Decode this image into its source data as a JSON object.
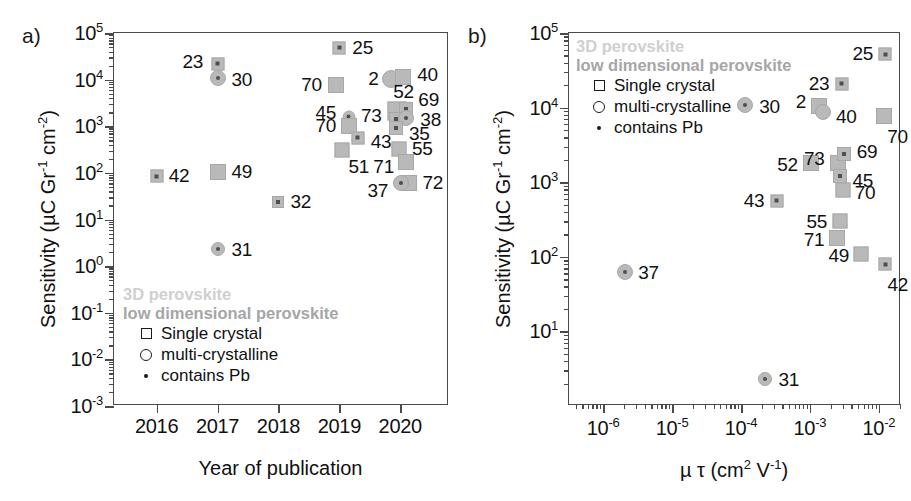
{
  "figure": {
    "panel_a_letter": "a)",
    "panel_b_letter": "b)"
  },
  "legend": {
    "head1": "3D perovskite",
    "head2": "low dimensional perovskite",
    "rows": [
      {
        "glyph": "square",
        "label": "Single crystal"
      },
      {
        "glyph": "circle",
        "label": "multi-crystalline"
      },
      {
        "glyph": "dot",
        "label": "contains Pb"
      }
    ],
    "colors": {
      "head1": "#cfcfcf",
      "head2": "#a6a6a6",
      "marker_fill": "#b9b9b9",
      "marker_edge": "#a8a8a8",
      "pb_dot": "#4f4f4f",
      "axis": "#4a4a4a",
      "text": "#111111"
    }
  },
  "chart_data": [
    {
      "id": "panel-a",
      "type": "scatter",
      "title": "",
      "xlabel": "Year of publication",
      "ylabel": "Sensitivity (µC Gr⁻¹ cm⁻²)",
      "xscale": "linear",
      "yscale": "log",
      "xlim": [
        2015.3,
        2020.8
      ],
      "ylim": [
        0.001,
        100000
      ],
      "xticks": [
        2016,
        2017,
        2018,
        2019,
        2020
      ],
      "xticklabels": [
        "2016",
        "2017",
        "2018",
        "2019",
        "2020"
      ],
      "yticks": [
        0.001,
        0.01,
        0.1,
        1,
        10,
        100,
        1000,
        10000,
        100000
      ],
      "yticklabels": [
        "10-3",
        "10-2",
        "10-1",
        "100",
        "101",
        "102",
        "103",
        "104",
        "105"
      ],
      "grid": false,
      "legend_position": "lower-left-inside",
      "points": [
        {
          "ref": "42",
          "x": 2016.0,
          "y": 85,
          "marker": "square",
          "pb": true,
          "size": 13,
          "label_dx": 12,
          "label_dy": 0
        },
        {
          "ref": "23",
          "x": 2017.0,
          "y": 22000,
          "marker": "square",
          "pb": true,
          "size": 13,
          "label_dx": -14,
          "label_dy": -2,
          "label_anchor": "end"
        },
        {
          "ref": "30",
          "x": 2017.0,
          "y": 11000,
          "marker": "circle",
          "pb": true,
          "size": 16,
          "label_dx": 14,
          "label_dy": 2
        },
        {
          "ref": "49",
          "x": 2017.0,
          "y": 105,
          "marker": "square",
          "pb": false,
          "size": 16,
          "label_dx": 14,
          "label_dy": 0
        },
        {
          "ref": "31",
          "x": 2017.0,
          "y": 2.3,
          "marker": "circle",
          "pb": true,
          "size": 14,
          "label_dx": 14,
          "label_dy": 1
        },
        {
          "ref": "32",
          "x": 2018.0,
          "y": 24,
          "marker": "square",
          "pb": true,
          "size": 12,
          "label_dx": 12,
          "label_dy": 0
        },
        {
          "ref": "25",
          "x": 2019.0,
          "y": 48000,
          "marker": "square",
          "pb": true,
          "size": 13,
          "label_dx": 13,
          "label_dy": 0
        },
        {
          "ref": "70",
          "x": 2018.95,
          "y": 7800,
          "marker": "square",
          "pb": false,
          "size": 16,
          "label_dx": -14,
          "label_dy": 0,
          "label_anchor": "end"
        },
        {
          "ref": "45",
          "x": 2019.15,
          "y": 1600,
          "marker": "circle",
          "pb": true,
          "size": 13,
          "label_dx": -12,
          "label_dy": -4,
          "label_anchor": "end"
        },
        {
          "ref": "70",
          "x": 2019.15,
          "y": 1000,
          "marker": "square",
          "pb": false,
          "size": 16,
          "label_dx": -12,
          "label_dy": 0,
          "label_anchor": "end"
        },
        {
          "ref": "43",
          "x": 2019.3,
          "y": 560,
          "marker": "square",
          "pb": true,
          "size": 13,
          "label_dx": 13,
          "label_dy": 4
        },
        {
          "ref": "51",
          "x": 2019.05,
          "y": 310,
          "marker": "square",
          "pb": false,
          "size": 15,
          "label_dx": 6,
          "label_dy": 17
        },
        {
          "ref": "2",
          "x": 2019.85,
          "y": 10500,
          "marker": "circle",
          "pb": false,
          "size": 18,
          "label_dx": -13,
          "label_dy": 0,
          "label_anchor": "end"
        },
        {
          "ref": "40",
          "x": 2020.05,
          "y": 11500,
          "marker": "square",
          "pb": false,
          "size": 16,
          "label_dx": 14,
          "label_dy": -2
        },
        {
          "ref": "52",
          "x": 2019.95,
          "y": 2100,
          "marker": "square",
          "pb": false,
          "size": 19,
          "label_dx": -4,
          "label_dy": -19
        },
        {
          "ref": "69",
          "x": 2020.1,
          "y": 2350,
          "marker": "square",
          "pb": true,
          "size": 14,
          "label_dx": 12,
          "label_dy": -9
        },
        {
          "ref": "73",
          "x": 2019.93,
          "y": 1400,
          "marker": "square",
          "pb": true,
          "size": 14,
          "label_dx": -14,
          "label_dy": -3,
          "label_anchor": "end"
        },
        {
          "ref": "38",
          "x": 2020.1,
          "y": 1500,
          "marker": "circle",
          "pb": true,
          "size": 16,
          "label_dx": 14,
          "label_dy": 2
        },
        {
          "ref": "35",
          "x": 2019.93,
          "y": 900,
          "marker": "square",
          "pb": true,
          "size": 14,
          "label_dx": 13,
          "label_dy": 6
        },
        {
          "ref": "55",
          "x": 2019.98,
          "y": 330,
          "marker": "square",
          "pb": false,
          "size": 15,
          "label_dx": 13,
          "label_dy": 0
        },
        {
          "ref": "71",
          "x": 2020.1,
          "y": 175,
          "marker": "square",
          "pb": false,
          "size": 16,
          "label_dx": -12,
          "label_dy": 5,
          "label_anchor": "end"
        },
        {
          "ref": "72",
          "x": 2020.15,
          "y": 62,
          "marker": "square",
          "pb": false,
          "size": 16,
          "label_dx": 13,
          "label_dy": 0
        },
        {
          "ref": "37",
          "x": 2020.02,
          "y": 62,
          "marker": "circle",
          "pb": true,
          "size": 16,
          "label_dx": -13,
          "label_dy": 8,
          "label_anchor": "end"
        }
      ]
    },
    {
      "id": "panel-b",
      "type": "scatter",
      "title": "",
      "xlabel": "µ τ (cm² V⁻¹)",
      "ylabel": "Sensitivity (µC Gr⁻¹ cm⁻²)",
      "xscale": "log",
      "yscale": "log",
      "xlim": [
        3.2e-07,
        0.021
      ],
      "ylim": [
        1.0,
        100000
      ],
      "xticks": [
        1e-06,
        1e-05,
        0.0001,
        0.001,
        0.01
      ],
      "xticklabels": [
        "10-6",
        "10-5",
        "10-4",
        "10-3",
        "10-2"
      ],
      "yticks": [
        10,
        100,
        1000,
        10000,
        100000
      ],
      "yticklabels": [
        "101",
        "102",
        "103",
        "104",
        "105"
      ],
      "grid": false,
      "legend_position": "upper-left-inside",
      "points": [
        {
          "ref": "37",
          "x": 2.1e-06,
          "y": 62,
          "marker": "circle",
          "pb": true,
          "size": 16,
          "label_dx": 13,
          "label_dy": 1
        },
        {
          "ref": "30",
          "x": 0.000115,
          "y": 11000,
          "marker": "circle",
          "pb": true,
          "size": 16,
          "label_dx": 14,
          "label_dy": 2
        },
        {
          "ref": "31",
          "x": 0.00022,
          "y": 2.3,
          "marker": "circle",
          "pb": true,
          "size": 14,
          "label_dx": 14,
          "label_dy": 1
        },
        {
          "ref": "43",
          "x": 0.00033,
          "y": 560,
          "marker": "square",
          "pb": true,
          "size": 13,
          "label_dx": -12,
          "label_dy": 0,
          "label_anchor": "end"
        },
        {
          "ref": "52",
          "x": 0.00105,
          "y": 1800,
          "marker": "square",
          "pb": false,
          "size": 16,
          "label_dx": -13,
          "label_dy": 2,
          "label_anchor": "end"
        },
        {
          "ref": "2",
          "x": 0.00135,
          "y": 10500,
          "marker": "square",
          "pb": false,
          "size": 16,
          "label_dx": -13,
          "label_dy": -4,
          "label_anchor": "end"
        },
        {
          "ref": "40",
          "x": 0.00155,
          "y": 8800,
          "marker": "circle",
          "pb": false,
          "size": 16,
          "label_dx": 13,
          "label_dy": 5
        },
        {
          "ref": "23",
          "x": 0.0029,
          "y": 21000,
          "marker": "square",
          "pb": true,
          "size": 13,
          "label_dx": -12,
          "label_dy": 0,
          "label_anchor": "end"
        },
        {
          "ref": "73",
          "x": 0.00255,
          "y": 1800,
          "marker": "square",
          "pb": false,
          "size": 16,
          "label_dx": -13,
          "label_dy": -4,
          "label_anchor": "end"
        },
        {
          "ref": "69",
          "x": 0.0031,
          "y": 2400,
          "marker": "square",
          "pb": true,
          "size": 14,
          "label_dx": 13,
          "label_dy": -2
        },
        {
          "ref": "45",
          "x": 0.0027,
          "y": 1200,
          "marker": "square",
          "pb": true,
          "size": 14,
          "label_dx": 13,
          "label_dy": 5
        },
        {
          "ref": "70",
          "x": 0.003,
          "y": 790,
          "marker": "square",
          "pb": false,
          "size": 15,
          "label_dx": 12,
          "label_dy": 3
        },
        {
          "ref": "55",
          "x": 0.0027,
          "y": 300,
          "marker": "square",
          "pb": false,
          "size": 15,
          "label_dx": -12,
          "label_dy": 1,
          "label_anchor": "end"
        },
        {
          "ref": "71",
          "x": 0.00245,
          "y": 180,
          "marker": "square",
          "pb": false,
          "size": 16,
          "label_dx": -12,
          "label_dy": 2,
          "label_anchor": "end"
        },
        {
          "ref": "49",
          "x": 0.0056,
          "y": 110,
          "marker": "square",
          "pb": false,
          "size": 15,
          "label_dx": -12,
          "label_dy": 2,
          "label_anchor": "end"
        },
        {
          "ref": "25",
          "x": 0.0125,
          "y": 52000,
          "marker": "square",
          "pb": true,
          "size": 13,
          "label_dx": -12,
          "label_dy": 0,
          "label_anchor": "end"
        },
        {
          "ref": "70",
          "x": 0.012,
          "y": 7800,
          "marker": "square",
          "pb": false,
          "size": 16,
          "label_dx": 3,
          "label_dy": 21
        },
        {
          "ref": "42",
          "x": 0.0125,
          "y": 80,
          "marker": "square",
          "pb": true,
          "size": 13,
          "label_dx": 2,
          "label_dy": 21
        }
      ]
    }
  ]
}
